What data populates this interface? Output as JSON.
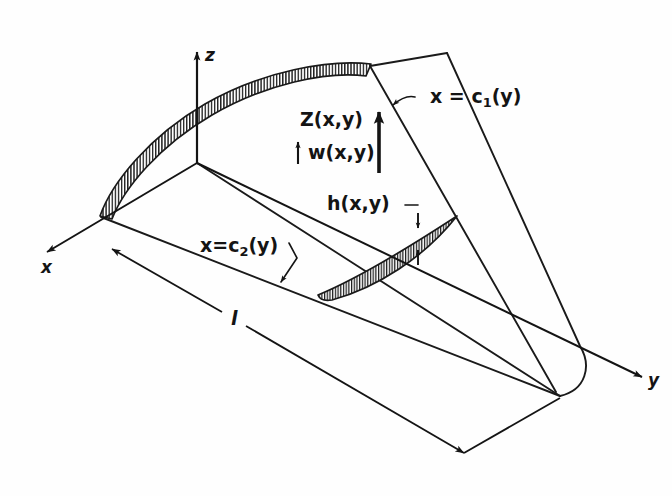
{
  "figure": {
    "type": "engineering-diagram",
    "background_color": "#fefefe",
    "ink_color": "#141414"
  },
  "axes": {
    "z": {
      "label": "z",
      "direction": "up"
    },
    "x": {
      "label": "x",
      "direction": "down-left"
    },
    "y": {
      "label": "y",
      "direction": "down-right"
    }
  },
  "labels": {
    "camber": "Z(x,y)",
    "downwash": "w(x,y)",
    "thickness": "h(x,y)",
    "leading_edge_prefix": "x = c",
    "leading_edge_sub": "1",
    "leading_edge_suffix": "(y)",
    "trailing_edge_prefix": "x=c",
    "trailing_edge_sub": "2",
    "trailing_edge_suffix": "(y)",
    "span_length": "l"
  },
  "geometry": {
    "origin": {
      "x": 197,
      "y": 162
    },
    "z_axis_tip": {
      "x": 197,
      "y": 48
    },
    "x_axis_tip": {
      "x": 45,
      "y": 253
    },
    "y_axis_tip": {
      "x": 645,
      "y": 379
    },
    "leading_edge_band_start": {
      "x": 100,
      "y": 215
    },
    "leading_edge_band_end": {
      "x": 370,
      "y": 65
    },
    "wing_tip_curve": {
      "x": 580,
      "y": 370
    },
    "dimension_line_start": {
      "x": 110,
      "y": 248
    },
    "dimension_line_end": {
      "x": 466,
      "y": 455
    }
  }
}
